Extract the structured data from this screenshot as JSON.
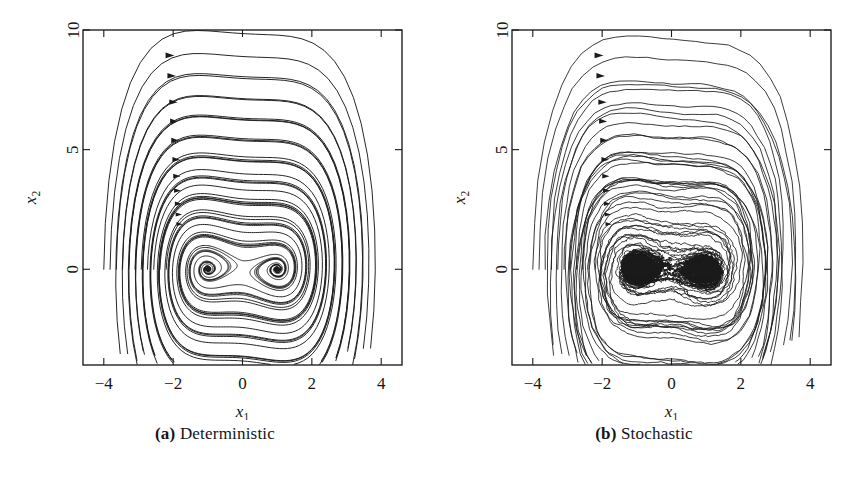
{
  "figure": {
    "background": "#ffffff",
    "ink_color": "#1a1a1a",
    "panels": [
      {
        "id": "a",
        "caption_label": "(a)",
        "caption_text": "Deterministic",
        "kind": "deterministic"
      },
      {
        "id": "b",
        "caption_label": "(b)",
        "caption_text": "Stochastic",
        "kind": "stochastic"
      }
    ]
  },
  "chart_data": {
    "type": "line",
    "title": "",
    "subtitle": "",
    "panels": [
      {
        "panel_id": "a",
        "caption": "(a) Deterministic",
        "xlabel": "x_1",
        "ylabel": "x_2",
        "xlim": [
          -4.6,
          4.6
        ],
        "ylim": [
          -4.0,
          10.0
        ],
        "xticks": [
          -4,
          -2,
          0,
          2,
          4
        ],
        "xticklabels": [
          "−4",
          "−2",
          "0",
          "2",
          "4"
        ],
        "yticks": [
          0,
          5,
          10
        ],
        "yticklabels": [
          "0",
          "5",
          "10"
        ],
        "grid": false,
        "legend": "none",
        "description": "Phase portrait of a planar dynamical system with two stable spiral foci at (-1, 0) and (1, 0). Eleven smooth trajectories launched along the x2 = 0 line between x1 = -4.0 and x1 = -2.2 sweep up and over to the right, then spiral inward onto the attractors.",
        "n_trajectories": 11,
        "initial_conditions_x1": [
          -4.0,
          -3.82,
          -3.64,
          -3.46,
          -3.28,
          -3.1,
          -2.92,
          -2.74,
          -2.56,
          -2.38,
          -2.2
        ],
        "initial_conditions_x2": 0.0,
        "fixed_points": [
          {
            "x1": -1.0,
            "x2": 0.0,
            "type": "stable-spiral"
          },
          {
            "x1": 1.0,
            "x2": 0.0,
            "type": "stable-spiral"
          }
        ],
        "arrow_markers_x1": [
          -2.1,
          -2.05,
          -2.0,
          -1.98,
          -1.95,
          -1.92,
          -1.9,
          -1.88,
          -1.86,
          -1.84,
          -1.82
        ],
        "arrow_markers_x2": [
          8.95,
          8.1,
          7.0,
          6.2,
          5.4,
          4.6,
          3.9,
          3.3,
          2.75,
          2.3,
          1.9
        ],
        "peak_x2_values": [
          8.95,
          8.1,
          7.05,
          6.2,
          5.4,
          4.65,
          3.95,
          3.35,
          2.8,
          2.35,
          1.95
        ],
        "max_x1_values": [
          2.85,
          2.75,
          2.62,
          2.5,
          2.38,
          2.25,
          2.1,
          1.95,
          1.8,
          1.62,
          1.45
        ],
        "min_x2_values": [
          -3.3,
          -3.05,
          -2.8,
          -2.55,
          -2.3,
          -2.05,
          -1.8,
          -1.55,
          -1.3,
          -1.05,
          -0.8
        ],
        "noise_amplitude": 0.0
      },
      {
        "panel_id": "b",
        "caption": "(b) Stochastic",
        "xlabel": "x_1",
        "ylabel": "x_2",
        "xlim": [
          -4.6,
          4.6
        ],
        "ylim": [
          -4.0,
          10.0
        ],
        "xticks": [
          -4,
          -2,
          0,
          2,
          4
        ],
        "xticklabels": [
          "−4",
          "−2",
          "0",
          "2",
          "4"
        ],
        "yticks": [
          0,
          5,
          10
        ],
        "yticklabels": [
          "0",
          "5",
          "10"
        ],
        "grid": false,
        "legend": "none",
        "description": "Same system driven by additive noise. The same eleven trajectories follow jagged, jittery versions of the deterministic orbits and accumulate as dense black clouds around the two attractors at (-1, 0) and (1, 0).",
        "n_trajectories": 11,
        "initial_conditions_x1": [
          -4.0,
          -3.82,
          -3.64,
          -3.46,
          -3.28,
          -3.1,
          -2.92,
          -2.74,
          -2.56,
          -2.38,
          -2.2
        ],
        "initial_conditions_x2": 0.0,
        "fixed_points": [
          {
            "x1": -1.0,
            "x2": 0.0,
            "type": "noisy-attractor-cloud"
          },
          {
            "x1": 1.0,
            "x2": 0.0,
            "type": "noisy-attractor-cloud"
          }
        ],
        "arrow_markers_x1": [
          -2.1,
          -2.05,
          -2.0,
          -1.98,
          -1.95,
          -1.92,
          -1.9,
          -1.88,
          -1.86,
          -1.84,
          -1.82
        ],
        "arrow_markers_x2": [
          8.95,
          8.1,
          7.0,
          6.2,
          5.4,
          4.6,
          3.9,
          3.3,
          2.75,
          2.3,
          1.9
        ],
        "peak_x2_values": [
          9.15,
          8.3,
          7.3,
          6.4,
          5.6,
          4.85,
          4.15,
          3.55,
          3.0,
          2.5,
          2.05
        ],
        "max_x1_values": [
          2.95,
          2.85,
          2.72,
          2.6,
          2.48,
          2.35,
          2.2,
          2.05,
          1.9,
          1.72,
          1.55
        ],
        "min_x2_values": [
          -3.45,
          -3.2,
          -2.95,
          -2.7,
          -2.45,
          -2.2,
          -1.95,
          -1.7,
          -1.45,
          -1.2,
          -0.95
        ],
        "noise_amplitude": 0.085
      }
    ]
  }
}
